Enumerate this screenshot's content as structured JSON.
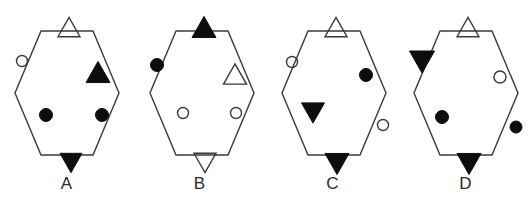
{
  "image": {
    "title": "Hexagon pattern multiple-choice options",
    "background_color": "#ffffff",
    "stroke_color": "#3a3a3a",
    "fill_color": "#0d0d0d",
    "width": 532,
    "height": 205
  },
  "figures": [
    {
      "label": "A",
      "hexagon": {
        "cx": 67,
        "cy": 93,
        "rx": 52,
        "ry": 62
      },
      "marks": [
        {
          "name": "open-triangle-up-top",
          "shape": "triangle-up",
          "fill": "open",
          "cx": 69,
          "cy": 27,
          "size": 22,
          "position": "outside-top"
        },
        {
          "name": "open-circle-upper-left",
          "shape": "circle",
          "fill": "open",
          "cx": 22,
          "cy": 61,
          "size": 11,
          "position": "outside-upper-left"
        },
        {
          "name": "filled-triangle-up-inner-right",
          "shape": "triangle-up",
          "fill": "filled",
          "cx": 98,
          "cy": 72,
          "size": 24,
          "position": "inside-upper-right"
        },
        {
          "name": "filled-circle-lower-left",
          "shape": "circle",
          "fill": "filled",
          "cx": 46,
          "cy": 115,
          "size": 13,
          "position": "inside-lower-left"
        },
        {
          "name": "filled-circle-lower-right",
          "shape": "circle",
          "fill": "filled",
          "cx": 102,
          "cy": 115,
          "size": 13,
          "position": "inside-lower-right"
        },
        {
          "name": "filled-triangle-down-bottom",
          "shape": "triangle-down",
          "fill": "filled",
          "cx": 71,
          "cy": 163,
          "size": 22,
          "position": "outside-bottom"
        }
      ]
    },
    {
      "label": "B",
      "hexagon": {
        "cx": 202,
        "cy": 93,
        "rx": 52,
        "ry": 62
      },
      "marks": [
        {
          "name": "filled-triangle-up-top",
          "shape": "triangle-up",
          "fill": "filled",
          "cx": 204,
          "cy": 27,
          "size": 24,
          "position": "outside-top"
        },
        {
          "name": "filled-circle-upper-left",
          "shape": "circle",
          "fill": "filled",
          "cx": 157,
          "cy": 65,
          "size": 13,
          "position": "outside-upper-left"
        },
        {
          "name": "open-triangle-up-inner-right",
          "shape": "triangle-up",
          "fill": "open",
          "cx": 235,
          "cy": 74,
          "size": 23,
          "position": "inside-upper-right"
        },
        {
          "name": "open-circle-lower-left",
          "shape": "circle",
          "fill": "open",
          "cx": 183,
          "cy": 113,
          "size": 11,
          "position": "inside-lower-left"
        },
        {
          "name": "open-circle-lower-right",
          "shape": "circle",
          "fill": "open",
          "cx": 236,
          "cy": 113,
          "size": 11,
          "position": "inside-lower-right"
        },
        {
          "name": "open-triangle-down-bottom",
          "shape": "triangle-down",
          "fill": "open",
          "cx": 205,
          "cy": 163,
          "size": 22,
          "position": "outside-bottom"
        }
      ]
    },
    {
      "label": "C",
      "hexagon": {
        "cx": 334,
        "cy": 93,
        "rx": 52,
        "ry": 62
      },
      "marks": [
        {
          "name": "open-triangle-up-top",
          "shape": "triangle-up",
          "fill": "open",
          "cx": 336,
          "cy": 27,
          "size": 22,
          "position": "outside-top"
        },
        {
          "name": "open-circle-upper-left",
          "shape": "circle",
          "fill": "open",
          "cx": 292,
          "cy": 62,
          "size": 11,
          "position": "outside-upper-left"
        },
        {
          "name": "filled-circle-upper-right",
          "shape": "circle",
          "fill": "filled",
          "cx": 366,
          "cy": 75,
          "size": 13,
          "position": "inside-upper-right"
        },
        {
          "name": "filled-triangle-down-inner-left",
          "shape": "triangle-down",
          "fill": "filled",
          "cx": 313,
          "cy": 113,
          "size": 23,
          "position": "inside-lower-left"
        },
        {
          "name": "open-circle-lower-right",
          "shape": "circle",
          "fill": "open",
          "cx": 383,
          "cy": 125,
          "size": 11,
          "position": "outside-lower-right"
        },
        {
          "name": "filled-triangle-down-bottom",
          "shape": "triangle-down",
          "fill": "filled",
          "cx": 337,
          "cy": 164,
          "size": 24,
          "position": "outside-bottom"
        }
      ]
    },
    {
      "label": "D",
      "hexagon": {
        "cx": 466,
        "cy": 93,
        "rx": 52,
        "ry": 62
      },
      "marks": [
        {
          "name": "open-triangle-up-top",
          "shape": "triangle-up",
          "fill": "open",
          "cx": 468,
          "cy": 27,
          "size": 22,
          "position": "outside-top"
        },
        {
          "name": "filled-triangle-down-upper-left",
          "shape": "triangle-down",
          "fill": "filled",
          "cx": 422,
          "cy": 62,
          "size": 25,
          "position": "outside-upper-left"
        },
        {
          "name": "open-circle-upper-right",
          "shape": "circle",
          "fill": "open",
          "cx": 500,
          "cy": 77,
          "size": 12,
          "position": "inside-upper-right"
        },
        {
          "name": "filled-circle-lower-left",
          "shape": "circle",
          "fill": "filled",
          "cx": 442,
          "cy": 117,
          "size": 13,
          "position": "inside-lower-left"
        },
        {
          "name": "filled-circle-lower-right",
          "shape": "circle",
          "fill": "filled",
          "cx": 516,
          "cy": 127,
          "size": 12,
          "position": "outside-lower-right"
        },
        {
          "name": "filled-triangle-down-bottom",
          "shape": "triangle-down",
          "fill": "filled",
          "cx": 469,
          "cy": 164,
          "size": 24,
          "position": "outside-bottom"
        }
      ]
    }
  ]
}
